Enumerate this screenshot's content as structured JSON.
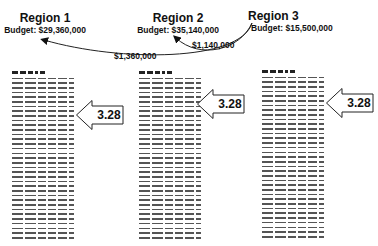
{
  "regions": [
    {
      "name": "Region 1",
      "budget": "Budget: $29,360,000"
    },
    {
      "name": "Region 2",
      "budget": "Budget: $35,140,000"
    },
    {
      "name": "Region 3",
      "budget": "Budget: $15,500,000"
    }
  ],
  "transfers": [
    {
      "from": "Region 3",
      "to": "Region 2",
      "amount": "$1,140,000"
    },
    {
      "from": "Region 3",
      "to": "Region 1",
      "amount": "$1,360,000"
    }
  ],
  "callouts": [
    {
      "column": 1,
      "value": "3.28"
    },
    {
      "column": 2,
      "value": "3.28"
    },
    {
      "column": 3,
      "value": "3.28"
    }
  ],
  "colors": {
    "text": "#111111",
    "lines": "#555555",
    "background": "#ffffff"
  }
}
